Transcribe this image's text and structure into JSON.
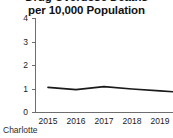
{
  "figure": {
    "title_clipped_line": "Drug Overdose Deaths",
    "title": "per 10,000 Population",
    "footnote": "Charlotte"
  },
  "chart_data": {
    "type": "line",
    "title": "per 10,000 Population",
    "xlabel": "",
    "ylabel": "",
    "categories": [
      "2015",
      "2016",
      "2017",
      "2018",
      "2019"
    ],
    "x": [
      2015,
      2016,
      2017,
      2018,
      2019
    ],
    "values": [
      1.05,
      0.95,
      1.08,
      0.98,
      0.9
    ],
    "series": [
      {
        "name": "Charlotte",
        "values": [
          1.05,
          0.95,
          1.08,
          0.98,
          0.9
        ]
      }
    ],
    "ylim": [
      0,
      4
    ],
    "yticks": [
      0,
      1,
      2,
      3,
      4
    ],
    "ytick_labels": [
      "0",
      "1",
      "2",
      "3",
      "4"
    ],
    "xtick_labels": [
      "2015",
      "2016",
      "2017",
      "2018",
      "2019"
    ],
    "grid": false,
    "legend": false,
    "line_color": "#1a1a1a",
    "axis_color": "#6e6e6e",
    "background": "#ffffff"
  }
}
